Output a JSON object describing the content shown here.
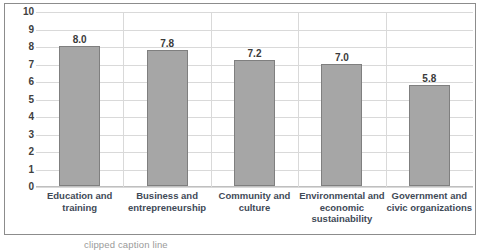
{
  "chart_data": {
    "type": "bar",
    "title": "",
    "subtitle": "",
    "xlabel": "",
    "ylabel": "",
    "ylim": [
      0,
      10
    ],
    "ystep": 1,
    "grid": true,
    "legend": "none",
    "orientation": "vertical",
    "bar_color": "#a6a6a6",
    "bar_border_color": "#7f7f7f",
    "gridline_color": "#d9d9d9",
    "label_color": "#3f4a57",
    "value_label_color": "#3a3a3a",
    "categories": [
      "Education and training",
      "Business and entrepreneurship",
      "Community and culture",
      "Environmental and economic sustainability",
      "Government and civic organizations"
    ],
    "category_lines": [
      [
        "Education and",
        "training"
      ],
      [
        "Business and",
        "entrepreneurship"
      ],
      [
        "Community and",
        "culture"
      ],
      [
        "Environmental and",
        "economic",
        "sustainability"
      ],
      [
        "Government and",
        "civic organizations"
      ]
    ],
    "values": [
      8.0,
      7.8,
      7.2,
      7.0,
      5.8
    ],
    "value_labels": [
      "8.0",
      "7.8",
      "7.2",
      "7.0",
      "5.8"
    ],
    "yticks": [
      10,
      9,
      8,
      7,
      6,
      5,
      4,
      3,
      2,
      1,
      0
    ],
    "ytick_labels": [
      "10",
      "9",
      "8",
      "7",
      "6",
      "5",
      "4",
      "3",
      "2",
      "1",
      "0"
    ]
  },
  "caption": {
    "text": "clipped caption line"
  }
}
